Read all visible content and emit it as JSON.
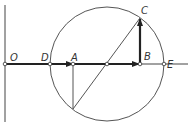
{
  "diagram": {
    "type": "phasor-circle-geometry",
    "labels": {
      "O": "O",
      "D": "D",
      "A": "A",
      "B": "B",
      "C": "C",
      "E": "E"
    },
    "points": {
      "O": [
        5,
        64
      ],
      "D": [
        50,
        64
      ],
      "A": [
        73,
        64
      ],
      "center": [
        107,
        64
      ],
      "B": [
        140,
        64
      ],
      "E": [
        164,
        64
      ],
      "C": [
        140,
        18
      ],
      "bottom": [
        73,
        109
      ]
    },
    "circle": {
      "cx": 107,
      "cy": 64,
      "r": 57
    },
    "colors": {
      "stroke": "#333333",
      "background": "#ffffff"
    }
  }
}
